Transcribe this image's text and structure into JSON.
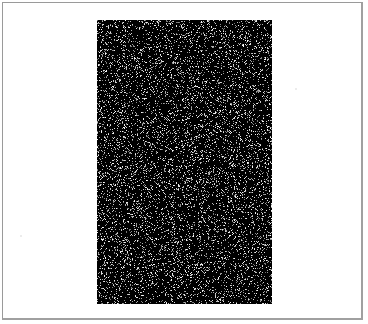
{
  "figure": {
    "background_color": "#ffffff",
    "border_color": "#9a9a9a",
    "panel": {
      "description": "black rectangle filled with random white speckle noise",
      "fill_color": "#000000",
      "speckle_color": "#ffffff",
      "speckle_density": 0.16,
      "seed": 7,
      "width": 175,
      "height": 284
    },
    "stray_marks": [
      {
        "x": 20,
        "y": 235
      },
      {
        "x": 295,
        "y": 88
      }
    ]
  }
}
